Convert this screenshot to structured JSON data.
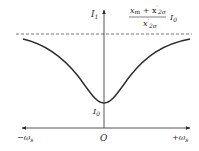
{
  "diagram": {
    "type": "current-vs-slip-frequency curve",
    "y_axis_label": "I",
    "y_axis_label_sub": "1",
    "x_axis_left_label": "−ω",
    "x_axis_left_label_sub": "s",
    "x_axis_right_label": "+ω",
    "x_axis_right_label_sub": "s",
    "origin_label": "O",
    "min_label": "I",
    "min_label_sub": "0",
    "asymptote": {
      "style": "dashed",
      "numerator_x": "x",
      "numerator_x_sub": "m",
      "numerator_plus": " + x",
      "numerator_prime": "′",
      "numerator_sub2": "2σ",
      "denominator_x": "x",
      "denominator_prime": "′",
      "denominator_sub": "2σ",
      "multiplier": "I",
      "multiplier_sub": "0"
    },
    "colors": {
      "line": "#2a2a2a",
      "dashed": "#555555",
      "background": "#ffffff"
    }
  }
}
